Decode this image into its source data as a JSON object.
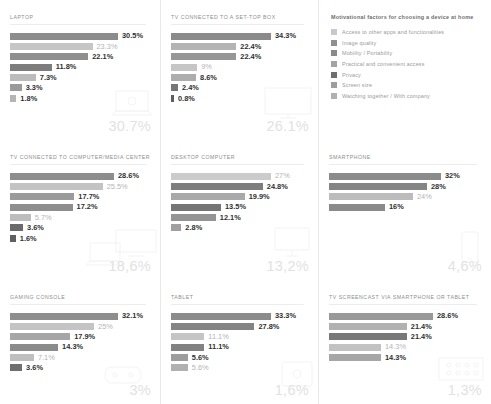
{
  "legend": {
    "title": "Motivational factors for choosing a device at home",
    "items": [
      {
        "label": "Access to other apps and functionalities",
        "color": "#c9c9c9"
      },
      {
        "label": "Image quality",
        "color": "#8f8f8f"
      },
      {
        "label": "Mobility / Portability",
        "color": "#8a8a8a"
      },
      {
        "label": "Practical and convenient access",
        "color": "#a3a3a3"
      },
      {
        "label": "Privacy",
        "color": "#6e6e6e"
      },
      {
        "label": "Screen size",
        "color": "#9e9e9e"
      },
      {
        "label": "Watching together / With company",
        "color": "#b0b0b0"
      }
    ]
  },
  "chart_data": [
    {
      "type": "bar",
      "title": "LAPTOP",
      "orientation": "horizontal",
      "big_value": "30.7%",
      "artwork": "laptop",
      "xlabel": "",
      "ylabel": "",
      "categories": [
        "",
        "",
        "",
        "",
        "",
        "",
        ""
      ],
      "values": [
        30.5,
        23.3,
        22.1,
        11.8,
        7.3,
        3.3,
        1.8
      ],
      "labels": [
        "30.5%",
        "23.3%",
        "22.1%",
        "11.8%",
        "7.3%",
        "3.3%",
        "1.8%"
      ],
      "colors": [
        "#8c8c8c",
        "#c6c6c6",
        "#8f8f8f",
        "#7d7d7d",
        "#bcbcbc",
        "#9a9a9a",
        "#b5b5b5"
      ],
      "label_styles": [
        "dark",
        "light",
        "dark",
        "dark",
        "dark",
        "dark",
        "dark"
      ]
    },
    {
      "type": "bar",
      "title": "TV CONNECTED TO A SET-TOP BOX",
      "orientation": "horizontal",
      "big_value": "26.1%",
      "artwork": "tv-box",
      "xlabel": "",
      "ylabel": "",
      "categories": [
        "",
        "",
        "",
        "",
        "",
        "",
        ""
      ],
      "values": [
        34.3,
        22.4,
        22.4,
        9.0,
        8.6,
        2.4,
        0.8
      ],
      "labels": [
        "34.3%",
        "22.4%",
        "22.4%",
        "9%",
        "8.6%",
        "2.4%",
        "0.8%"
      ],
      "colors": [
        "#8a8a8a",
        "#b4b4b4",
        "#979797",
        "#c6c6c6",
        "#adadad",
        "#767676",
        "#5e5e5e"
      ],
      "label_styles": [
        "dark",
        "dark",
        "dark",
        "light",
        "dark",
        "dark",
        "dark"
      ]
    },
    {
      "type": "bar",
      "title": "TV CONNECTED TO COMPUTER/MEDIA CENTER",
      "orientation": "horizontal",
      "big_value": "18,6%",
      "artwork": "tv-computer",
      "xlabel": "",
      "ylabel": "",
      "categories": [
        "",
        "",
        "",
        "",
        "",
        "",
        ""
      ],
      "values": [
        28.6,
        25.5,
        17.7,
        17.2,
        5.7,
        3.6,
        1.6
      ],
      "labels": [
        "28.6%",
        "25.5%",
        "17.7%",
        "17.2%",
        "5.7%",
        "3.6%",
        "1.6%"
      ],
      "colors": [
        "#8d8d8d",
        "#c3c3c3",
        "#9b9b9b",
        "#8e8e8e",
        "#bdbdbd",
        "#6a6a6a",
        "#5f5f5f"
      ],
      "label_styles": [
        "dark",
        "light",
        "dark",
        "dark",
        "light",
        "dark",
        "dark"
      ]
    },
    {
      "type": "bar",
      "title": "DESKTOP COMPUTER",
      "orientation": "horizontal",
      "big_value": "13,2%",
      "artwork": "desktop",
      "xlabel": "",
      "ylabel": "",
      "categories": [
        "",
        "",
        "",
        "",
        "",
        ""
      ],
      "values": [
        27.0,
        24.8,
        19.9,
        13.5,
        12.1,
        2.8
      ],
      "labels": [
        "27%",
        "24.8%",
        "19.9%",
        "13.5%",
        "12.1%",
        "2.8%"
      ],
      "colors": [
        "#cbcbcb",
        "#7e7e7e",
        "#a9a9a9",
        "#757575",
        "#949494",
        "#a0a0a0"
      ],
      "label_styles": [
        "light",
        "dark",
        "dark",
        "dark",
        "dark",
        "dark"
      ]
    },
    {
      "type": "bar",
      "title": "SMARTPHONE",
      "orientation": "horizontal",
      "big_value": "4,6%",
      "artwork": "smartphone",
      "xlabel": "",
      "ylabel": "",
      "categories": [
        "",
        "",
        "",
        ""
      ],
      "values": [
        32.0,
        28.0,
        24.0,
        16.0
      ],
      "labels": [
        "32%",
        "28%",
        "24%",
        "16%"
      ],
      "colors": [
        "#8b8b8b",
        "#858585",
        "#bcbcbc",
        "#8a8a8a"
      ],
      "label_styles": [
        "dark",
        "dark",
        "light",
        "dark"
      ]
    },
    {
      "type": "bar",
      "title": "GAMING CONSOLE",
      "orientation": "horizontal",
      "big_value": "3%",
      "artwork": "gamepad",
      "xlabel": "",
      "ylabel": "",
      "categories": [
        "",
        "",
        "",
        "",
        "",
        ""
      ],
      "values": [
        32.1,
        25.0,
        17.9,
        14.3,
        7.1,
        3.6
      ],
      "labels": [
        "32.1%",
        "25%",
        "17.9%",
        "14.3%",
        "7.1%",
        "3.6%"
      ],
      "colors": [
        "#8e8e8e",
        "#c4c4c4",
        "#a6a6a6",
        "#8b8b8b",
        "#bfbfbf",
        "#6f6f6f"
      ],
      "label_styles": [
        "dark",
        "light",
        "dark",
        "dark",
        "light",
        "dark"
      ]
    },
    {
      "type": "bar",
      "title": "TABLET",
      "orientation": "horizontal",
      "big_value": "1,6%",
      "artwork": "tablet",
      "xlabel": "",
      "ylabel": "",
      "categories": [
        "",
        "",
        "",
        "",
        "",
        ""
      ],
      "values": [
        33.3,
        27.8,
        11.1,
        11.1,
        5.6,
        5.6
      ],
      "labels": [
        "33.3%",
        "27.8%",
        "11.1%",
        "11.1%",
        "5.6%",
        "5.6%"
      ],
      "colors": [
        "#8b8b8b",
        "#848484",
        "#c5c5c5",
        "#828282",
        "#9d9d9d",
        "#b0b0b0"
      ],
      "label_styles": [
        "dark",
        "dark",
        "light",
        "dark",
        "dark",
        "light"
      ]
    },
    {
      "type": "bar",
      "title": "TV SCREENCAST VIA SMARTPHONE OR TABLET",
      "orientation": "horizontal",
      "big_value": "1,3%",
      "artwork": "screencast",
      "xlabel": "",
      "ylabel": "",
      "categories": [
        "",
        "",
        "",
        "",
        ""
      ],
      "values": [
        28.6,
        21.4,
        21.4,
        14.3,
        14.3
      ],
      "labels": [
        "28.6%",
        "21.4%",
        "21.4%",
        "14.3%",
        "14.3%"
      ],
      "colors": [
        "#999999",
        "#b1b1b1",
        "#787878",
        "#c2c2c2",
        "#a7a7a7"
      ],
      "label_styles": [
        "dark",
        "dark",
        "dark",
        "light",
        "dark"
      ]
    }
  ]
}
